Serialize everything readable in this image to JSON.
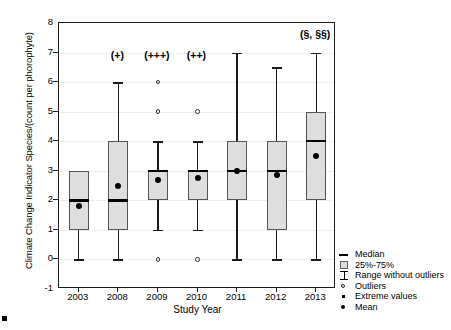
{
  "chart_data": {
    "type": "box",
    "title": "",
    "xlabel": "Study Year",
    "ylabel": "Climate Change Indicator Species/(count per phorophyte)",
    "ylim": [
      -1,
      8
    ],
    "yticks": [
      -1,
      0,
      1,
      2,
      3,
      4,
      5,
      6,
      7,
      8
    ],
    "categories": [
      "2003",
      "2008",
      "2009",
      "2010",
      "2011",
      "2012",
      "2013"
    ],
    "grid": true,
    "legend_position": "right-bottom-outside",
    "boxes": [
      {
        "category": "2003",
        "whisker_low": 0,
        "q1": 1,
        "median": 2,
        "mean": 1.8,
        "q3": 3,
        "whisker_high": 3,
        "outliers": [],
        "extremes": [],
        "annotation": ""
      },
      {
        "category": "2008",
        "whisker_low": 0,
        "q1": 1,
        "median": 2,
        "mean": 2.5,
        "q3": 4,
        "whisker_high": 6,
        "outliers": [],
        "extremes": [],
        "annotation": "(+)"
      },
      {
        "category": "2009",
        "whisker_low": 1,
        "q1": 2,
        "median": 3,
        "mean": 2.7,
        "q3": 3,
        "whisker_high": 4,
        "outliers": [
          0,
          5,
          6
        ],
        "extremes": [],
        "annotation": "(+++)"
      },
      {
        "category": "2010",
        "whisker_low": 1,
        "q1": 2,
        "median": 3,
        "mean": 2.75,
        "q3": 3,
        "whisker_high": 4,
        "outliers": [
          0,
          5
        ],
        "extremes": [],
        "annotation": "(++)"
      },
      {
        "category": "2011",
        "whisker_low": 0,
        "q1": 2,
        "median": 3,
        "mean": 3.0,
        "q3": 4,
        "whisker_high": 7,
        "outliers": [],
        "extremes": [],
        "annotation": ""
      },
      {
        "category": "2012",
        "whisker_low": 0,
        "q1": 1,
        "median": 3,
        "mean": 2.85,
        "q3": 4,
        "whisker_high": 6.5,
        "outliers": [],
        "extremes": [],
        "annotation": ""
      },
      {
        "category": "2013",
        "whisker_low": 0,
        "q1": 2,
        "median": 4,
        "mean": 3.5,
        "q3": 5,
        "whisker_high": 7,
        "outliers": [],
        "extremes": [],
        "annotation": "(§, §§)"
      }
    ],
    "legend": [
      {
        "key": "median-line",
        "label": "Median"
      },
      {
        "key": "iqr-swatch",
        "label": "25%-75%"
      },
      {
        "key": "range-bar",
        "label": "Range without outliers"
      },
      {
        "key": "outlier-circle",
        "label": "Outliers"
      },
      {
        "key": "extreme-square",
        "label": "Extreme values"
      },
      {
        "key": "mean-dot",
        "label": "Mean"
      }
    ],
    "colors": {
      "box_fill": "#dedede",
      "box_edge": "#555555",
      "median": "#000000",
      "whisker": "#1a1a1a",
      "mean": "#000000",
      "axis": "#1a1a1a",
      "grid": "#eeeeee",
      "background": "#ffffff"
    }
  }
}
